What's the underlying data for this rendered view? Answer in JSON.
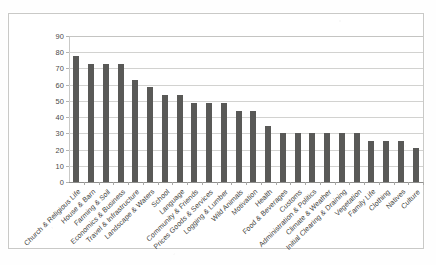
{
  "figure": {
    "kind": "scanned-bar-chart-figure",
    "frame_border_color": "#c9c9c7",
    "background_color": "#ffffff"
  },
  "chart_data": {
    "type": "bar",
    "title": "",
    "subtitle": "",
    "xlabel": "",
    "ylabel": "",
    "ylim": [
      0,
      90
    ],
    "ytick_step": 10,
    "ytick_labels": [
      "0",
      "10",
      "20",
      "30",
      "40",
      "50",
      "60",
      "70",
      "80",
      "90"
    ],
    "grid": true,
    "grid_axis": "y",
    "legend": false,
    "legend_position": "none",
    "bar_color": "#595957",
    "gridline_color": "#d2d2d0",
    "categories": [
      "Church & Religious Life",
      "House & Barn",
      "Farming & Soil",
      "Economics & Business",
      "Travel & Infrastructure",
      "Landscape & Waters",
      "School",
      "Language",
      "Community & Friends",
      "Prices Goods & Services",
      "Logging & Lumber",
      "Wild Animals",
      "Motivation",
      "Health",
      "Food  & Beverages",
      "Customs",
      "Administration & Politics",
      "Climate & Weather",
      "Initial Clearing & Draining",
      "Vegetation",
      "Family Life",
      "Clothing",
      "Natives",
      "Culture"
    ],
    "values": [
      77.5,
      72.7,
      72.7,
      72.7,
      63.0,
      58.3,
      53.5,
      53.5,
      48.8,
      48.8,
      48.8,
      44.0,
      44.0,
      34.5,
      30.2,
      30.2,
      30.2,
      30.2,
      30.2,
      30.2,
      25.4,
      25.4,
      25.4,
      21.0
    ]
  }
}
